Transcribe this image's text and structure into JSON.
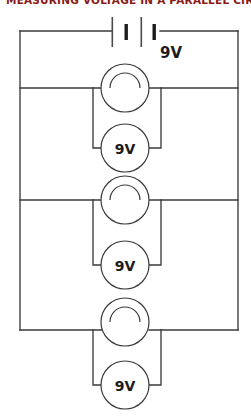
{
  "diagram": {
    "title": "MEASURING VOLTAGE IN A PARALLEL CIRCUIT",
    "title_color": "#8a1a16",
    "wire_color": "#3a3a3a",
    "background": "#ffffff",
    "circuit_type": "parallel",
    "battery": {
      "name": "battery",
      "label": "9V",
      "cells": 2,
      "plates": [
        "long",
        "short",
        "long",
        "short"
      ]
    },
    "branches": [
      {
        "index": 1,
        "lamp_label": "",
        "voltmeter_label": "9V"
      },
      {
        "index": 2,
        "lamp_label": "",
        "voltmeter_label": "9V"
      },
      {
        "index": 3,
        "lamp_label": "",
        "voltmeter_label": "9V"
      }
    ],
    "component_names": {
      "lamp": "lamp",
      "voltmeter": "voltmeter",
      "battery": "battery"
    }
  }
}
